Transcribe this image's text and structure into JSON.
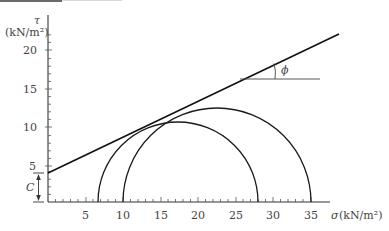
{
  "diagram": {
    "type": "mohr-coulomb-envelope",
    "y_axis": {
      "symbol": "τ",
      "unit": "(kN/m²)",
      "ticks": [
        "5",
        "10",
        "15",
        "20"
      ]
    },
    "x_axis": {
      "symbol": "σ",
      "unit": "(kN/m²)",
      "label": "σ (kN/m²)",
      "ticks": [
        "5",
        "10",
        "15",
        "20",
        "25",
        "30",
        "35"
      ]
    },
    "cohesion_label": "C",
    "angle_label": "ϕ",
    "circles": [
      {
        "name": "circle-1",
        "sigma3": 6.7,
        "sigma1": 28
      },
      {
        "name": "circle-2",
        "sigma3": 10,
        "sigma1": 35
      }
    ],
    "envelope": {
      "intercept_c": 4.2,
      "from": [
        0,
        4.2
      ],
      "to": [
        38.8,
        22.5
      ]
    },
    "colors": {
      "line": "#1a1a1a",
      "text": "#444444",
      "axis": "#333333"
    }
  }
}
